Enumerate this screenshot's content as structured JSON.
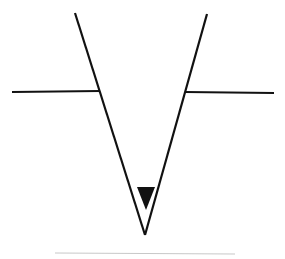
{
  "diagram": {
    "type": "water-level-symbol",
    "colors": {
      "stroke": "#111111",
      "fill": "#111111",
      "baseline": "#c8c8c8",
      "background": "#ffffff"
    },
    "shapes": {
      "left_arm": {
        "x1": 75,
        "y1": 13,
        "x2": 145,
        "y2": 235
      },
      "right_arm": {
        "x1": 207,
        "y1": 14,
        "x2": 145,
        "y2": 235
      },
      "left_ledge": {
        "x1": 12,
        "y1": 92,
        "x2": 100,
        "y2": 91
      },
      "right_ledge": {
        "x1": 185,
        "y1": 92,
        "x2": 274,
        "y2": 93
      },
      "marker_triangle": {
        "points": "137,187 155,187 146,210"
      },
      "baseline": {
        "x1": 55,
        "y1": 253,
        "x2": 235,
        "y2": 254
      }
    }
  }
}
